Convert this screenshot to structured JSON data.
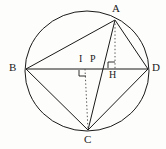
{
  "figure": {
    "name": "cyclic-quadrilateral-abcd-with-altitudes",
    "background_color": "#fdfdfb",
    "stroke_color": "#1a1a1a",
    "label_color": "#1a1a1a",
    "canvas": {
      "width": 166,
      "height": 149
    }
  },
  "circle": {
    "center_x": 87,
    "center_y": 71,
    "radius_x": 62,
    "radius_y": 60
  },
  "points": [
    {
      "id": "A",
      "label": "A",
      "x": 115,
      "y": 20,
      "label_x": 112,
      "label_y": 3
    },
    {
      "id": "B",
      "label": "B",
      "x": 26,
      "y": 69,
      "label_x": 9,
      "label_y": 63
    },
    {
      "id": "C",
      "label": "C",
      "x": 88,
      "y": 130,
      "label_x": 84,
      "label_y": 135
    },
    {
      "id": "D",
      "label": "D",
      "x": 148,
      "y": 69,
      "label_x": 152,
      "label_y": 63
    },
    {
      "id": "I",
      "label": "I",
      "x": 85,
      "y": 69,
      "label_x": 79,
      "label_y": 54
    },
    {
      "id": "P",
      "label": "P",
      "x": 96,
      "y": 69,
      "label_x": 91,
      "label_y": 54
    },
    {
      "id": "H",
      "label": "H",
      "x": 115,
      "y": 69,
      "label_x": 110,
      "label_y": 70
    }
  ],
  "segments": [
    {
      "name": "chord-b-d",
      "from": "B",
      "to": "D",
      "style": "solid"
    },
    {
      "name": "chord-a-b",
      "from": "A",
      "to": "B",
      "style": "solid"
    },
    {
      "name": "chord-a-d",
      "from": "A",
      "to": "D",
      "style": "solid"
    },
    {
      "name": "chord-b-c",
      "from": "B",
      "to": "C",
      "style": "solid"
    },
    {
      "name": "chord-c-d",
      "from": "C",
      "to": "D",
      "style": "solid"
    },
    {
      "name": "diagonal-a-c",
      "from": "A",
      "to": "C",
      "style": "solid"
    },
    {
      "name": "altitude-a-h",
      "from": "A",
      "to": "H",
      "style": "dotted"
    },
    {
      "name": "altitude-c-i",
      "from": "C",
      "to": "I",
      "style": "dotted"
    }
  ],
  "right_angle_marks": [
    {
      "name": "right-angle-at-h",
      "at": "H",
      "orientation": "above-left"
    },
    {
      "name": "right-angle-at-i",
      "at": "I",
      "orientation": "below-right"
    }
  ]
}
